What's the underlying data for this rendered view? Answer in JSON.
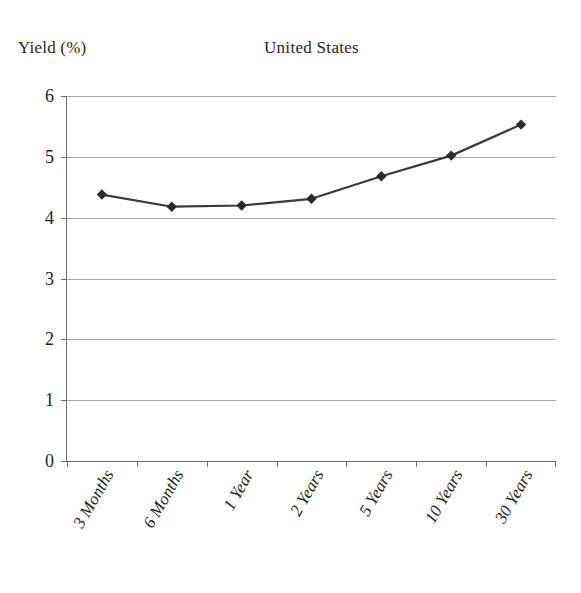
{
  "chart_data": {
    "type": "line",
    "title": "United States",
    "xlabel": "",
    "ylabel": "Yield (%)",
    "categories": [
      "3 Months",
      "6 Months",
      "1 Year",
      "2 Years",
      "5 Years",
      "10 Years",
      "30 Years"
    ],
    "values": [
      4.38,
      4.18,
      4.2,
      4.31,
      4.68,
      5.02,
      5.53
    ],
    "series": [
      {
        "name": "Yield",
        "values": [
          4.38,
          4.18,
          4.2,
          4.31,
          4.68,
          5.02,
          5.53
        ]
      }
    ],
    "ylim": [
      0,
      6
    ],
    "yticks": [
      0,
      1,
      2,
      3,
      4,
      5,
      6
    ],
    "ytick_labels": [
      "0",
      "1",
      "2",
      "3",
      "4",
      "5",
      "6"
    ],
    "grid": true,
    "grid_axis": "y",
    "legend": false,
    "legend_position": "none",
    "marker": "diamond",
    "line_color": "#3a3a3a",
    "marker_color": "#2b2b2b",
    "grid_color": "#a9a9a9",
    "axis_color": "#6e6e6e",
    "background_color": "#ffffff",
    "text_color": "#231f20"
  }
}
